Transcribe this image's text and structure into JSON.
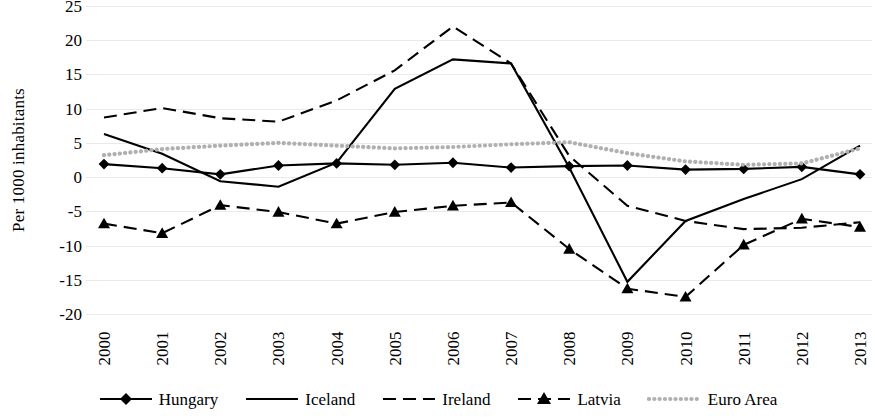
{
  "chart_data": {
    "type": "line",
    "title": "",
    "xlabel": "",
    "ylabel": "Per 1000 inhabitants",
    "categories": [
      "2000",
      "2001",
      "2002",
      "2003",
      "2004",
      "2005",
      "2006",
      "2007",
      "2008",
      "2009",
      "2010",
      "2011",
      "2012",
      "2013"
    ],
    "ylim": [
      -20,
      25
    ],
    "ytick_labels": [
      "25",
      "20",
      "15",
      "10",
      "5",
      "0",
      "-5",
      "-10",
      "-15",
      "-20"
    ],
    "yticks": [
      25,
      20,
      15,
      10,
      5,
      0,
      -5,
      -10,
      -15,
      -20
    ],
    "grid": true,
    "legend_position": "bottom",
    "series": [
      {
        "name": "Hungary",
        "style": "solid-marker",
        "marker": "diamond",
        "color": "#000000",
        "values": [
          1.9,
          1.3,
          0.4,
          1.7,
          2.0,
          1.8,
          2.1,
          1.4,
          1.6,
          1.7,
          1.1,
          1.2,
          1.5,
          0.4
        ]
      },
      {
        "name": "Iceland",
        "style": "solid",
        "marker": "none",
        "color": "#000000",
        "values": [
          6.3,
          3.4,
          -0.6,
          -1.4,
          2.1,
          12.9,
          17.2,
          16.6,
          1.4,
          -15.3,
          -6.4,
          -3.2,
          -0.3,
          4.6
        ]
      },
      {
        "name": "Ireland",
        "style": "dashed",
        "marker": "none",
        "color": "#000000",
        "values": [
          8.7,
          10.1,
          8.6,
          8.1,
          11.2,
          15.6,
          22.0,
          16.6,
          3.1,
          -4.2,
          -6.4,
          -7.6,
          -7.4,
          -6.6
        ]
      },
      {
        "name": "Latvia",
        "style": "dashed-marker",
        "marker": "triangle",
        "color": "#000000",
        "values": [
          -6.8,
          -8.2,
          -4.1,
          -5.1,
          -6.8,
          -5.1,
          -4.2,
          -3.7,
          -10.5,
          -16.3,
          -17.5,
          -9.9,
          -6.1,
          -7.3
        ]
      },
      {
        "name": "Euro Area",
        "style": "dotted",
        "marker": "none",
        "color": "#b0b0b0",
        "values": [
          3.2,
          4.1,
          4.6,
          5.0,
          4.6,
          4.2,
          4.4,
          4.8,
          5.1,
          3.5,
          2.3,
          1.8,
          2.0,
          4.2
        ]
      }
    ]
  },
  "legend": {
    "items": [
      {
        "label": "Hungary"
      },
      {
        "label": "Iceland"
      },
      {
        "label": "Ireland"
      },
      {
        "label": "Latvia"
      },
      {
        "label": "Euro Area"
      }
    ]
  }
}
